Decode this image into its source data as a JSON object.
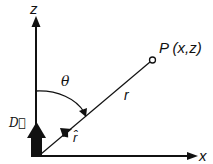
{
  "diagram": {
    "type": "coordinate-geometry",
    "labels": {
      "z_axis": "z",
      "x_axis": "x",
      "theta": "θ",
      "point": "P (x,z)",
      "r": "r",
      "r_hat": "r̂",
      "dipole": "D⃗"
    },
    "colors": {
      "ink": "#111111",
      "background": "#ffffff"
    }
  }
}
